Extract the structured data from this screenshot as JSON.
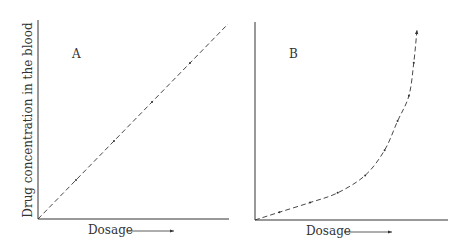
{
  "figure": {
    "y_axis_label": "Drug concentration in the blood",
    "panels": [
      {
        "id": "A",
        "label": "A",
        "x_label": "Dosage",
        "curve_type": "linear",
        "points": [
          [
            0,
            0
          ],
          [
            0.2,
            0.2
          ],
          [
            0.4,
            0.4
          ],
          [
            0.6,
            0.6
          ],
          [
            0.8,
            0.8
          ],
          [
            1,
            1
          ]
        ]
      },
      {
        "id": "B",
        "label": "B",
        "x_label": "Dosage",
        "curve_type": "exponential",
        "points": [
          [
            0,
            0
          ],
          [
            0.15,
            0.04
          ],
          [
            0.34,
            0.09
          ],
          [
            0.51,
            0.14
          ],
          [
            0.68,
            0.23
          ],
          [
            0.8,
            0.36
          ],
          [
            0.88,
            0.51
          ],
          [
            0.95,
            0.64
          ],
          [
            0.98,
            0.81
          ],
          [
            1,
            0.98
          ]
        ]
      }
    ],
    "colors": {
      "ink": "#333333",
      "background": "#ffffff"
    }
  }
}
